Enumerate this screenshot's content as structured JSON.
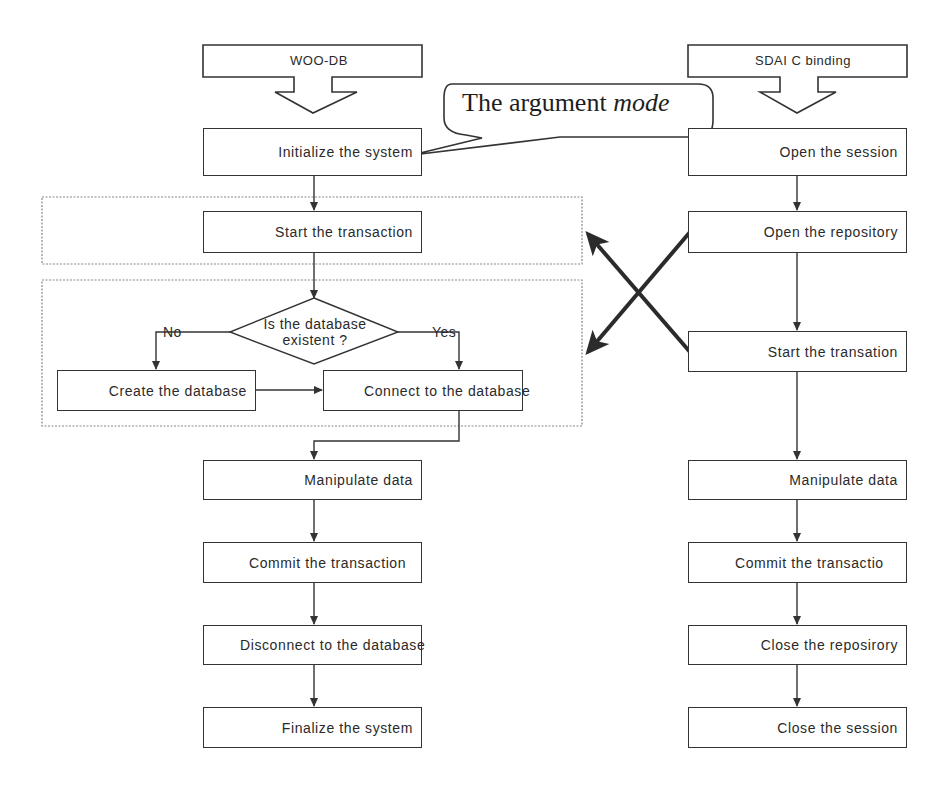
{
  "diagram": {
    "left_column": {
      "header": "WOO-DB",
      "steps": [
        "Initialize the system",
        "Start the transaction",
        "Create the database",
        "Connect to the database",
        "Manipulate data",
        "Commit the transaction",
        "Disconnect to the database",
        "Finalize the system"
      ],
      "decision": {
        "line1": "Is the database",
        "line2": "existent ?",
        "no_label": "No",
        "yes_label": "Yes"
      }
    },
    "right_column": {
      "header": "SDAI C binding",
      "steps": [
        "Open the session",
        "Open the repository",
        "Start the transation",
        "Manipulate data",
        "Commit the transactio",
        "Close the reposirory",
        "Close the session"
      ]
    },
    "callout": {
      "text_plain": "The argument ",
      "text_italic": "mode"
    },
    "colors": {
      "line": "#333333",
      "thick_arrow": "#2b2b2b",
      "dotted_group": "#888888",
      "background": "#ffffff"
    }
  }
}
